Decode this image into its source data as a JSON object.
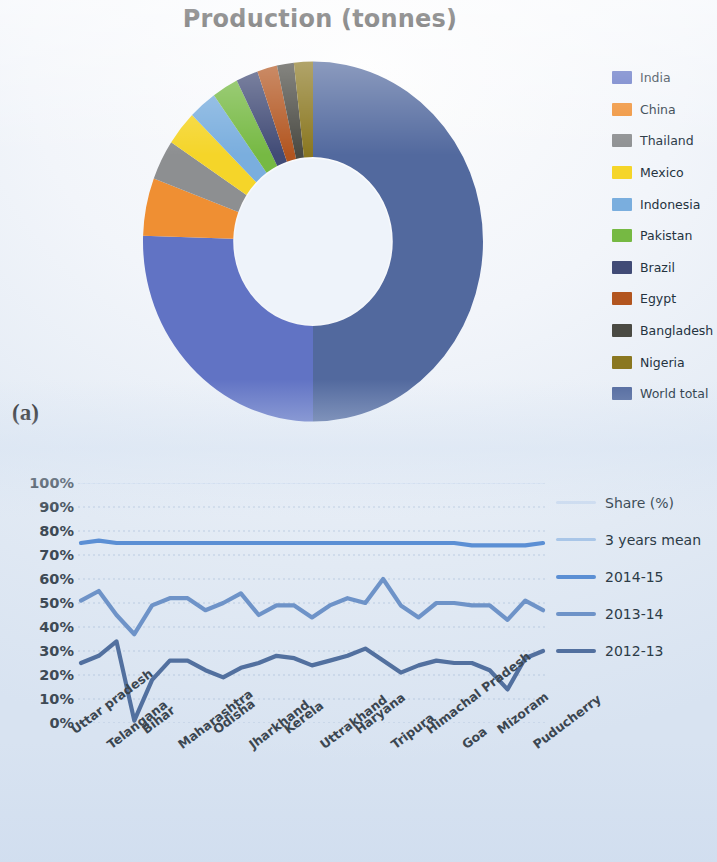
{
  "figure": {
    "panel_a_tag": "(a)",
    "panel_b_tag": "(b)"
  },
  "panel_a": {
    "title": "Production (tonnes)",
    "legend_title": "",
    "legend": [
      {
        "label": "India",
        "color": "#6173c4"
      },
      {
        "label": "China",
        "color": "#ef8f33"
      },
      {
        "label": "Thailand",
        "color": "#8d8f91"
      },
      {
        "label": "Mexico",
        "color": "#f5d529"
      },
      {
        "label": "Indonesia",
        "color": "#7aaede"
      },
      {
        "label": "Pakistan",
        "color": "#76b943"
      },
      {
        "label": "Brazil",
        "color": "#414b76"
      },
      {
        "label": "Egypt",
        "color": "#b2551f"
      },
      {
        "label": "Bangladesh",
        "color": "#4a4a43"
      },
      {
        "label": "Nigeria",
        "color": "#8a7720"
      },
      {
        "label": "World total",
        "color": "#52699e"
      }
    ],
    "chart_data": {
      "type": "pie",
      "title": "Production (tonnes)",
      "donut": true,
      "hole_ratio": 0.46,
      "start_angle_deg": 0,
      "direction": "clockwise",
      "labels": [
        "World total",
        "India",
        "China",
        "Thailand",
        "Mexico",
        "Indonesia",
        "Pakistan",
        "Brazil",
        "Egypt",
        "Bangladesh",
        "Nigeria"
      ],
      "values": [
        50.0,
        25.5,
        5.2,
        3.6,
        3.1,
        2.7,
        2.5,
        2.1,
        1.9,
        1.6,
        1.8
      ],
      "unit": "%",
      "colors": [
        "#52699e",
        "#6173c4",
        "#ef8f33",
        "#8d8f91",
        "#f5d529",
        "#7aaede",
        "#76b943",
        "#414b76",
        "#b2551f",
        "#4a4a43",
        "#8a7720"
      ],
      "legend_position": "right"
    }
  },
  "panel_b": {
    "legend": [
      {
        "label": "Share (%)",
        "color": "#cddcf0"
      },
      {
        "label": "3 years mean",
        "color": "#a9c6e8"
      },
      {
        "label": "2014-15",
        "color": "#5b8fd4"
      },
      {
        "label": "2013-14",
        "color": "#6e93c8"
      },
      {
        "label": "2012-13",
        "color": "#52709f"
      }
    ],
    "y_ticks": [
      "100%",
      "90%",
      "80%",
      "70%",
      "60%",
      "50%",
      "40%",
      "30%",
      "20%",
      "10%",
      "0%"
    ],
    "x_ticks": [
      "Uttar pradesh",
      "Telangana",
      "Bihar",
      "Maharashtra",
      "Odisha",
      "Jharkhand",
      "Kerela",
      "Uttrakhand",
      "Haryana",
      "Tripura",
      "Himachal Pradesh",
      "Goa",
      "Mizoram",
      "Puducherry"
    ],
    "chart_data": {
      "type": "line",
      "title": "",
      "xlabel": "",
      "ylabel": "",
      "ylim": [
        0,
        100
      ],
      "yunit": "%",
      "ytick_step": 10,
      "grid": true,
      "legend_position": "right",
      "categories": [
        "Uttar pradesh",
        "Telangana",
        "Bihar",
        "Maharashtra",
        "Odisha",
        "Jharkhand",
        "Kerela",
        "Uttrakhand",
        "Haryana",
        "Tripura",
        "Himachal Pradesh",
        "Goa",
        "Mizoram",
        "Puducherry"
      ],
      "x_points": 27,
      "note": "14 category labels are placed under every other data point of 27 plotted points",
      "series": [
        {
          "name": "Share (%)",
          "color": "#cddcf0",
          "values": [
            100,
            100,
            100,
            100,
            100,
            100,
            100,
            100,
            100,
            100,
            100,
            100,
            100,
            100,
            100,
            100,
            100,
            100,
            100,
            100,
            100,
            100,
            100,
            100,
            100,
            100,
            100
          ]
        },
        {
          "name": "3 years mean",
          "color": "#a9c6e8",
          "values": [
            75,
            75,
            75,
            75,
            75,
            75,
            75,
            75,
            75,
            75,
            75,
            75,
            75,
            75,
            75,
            75,
            75,
            75,
            75,
            75,
            75,
            75,
            75,
            75,
            75,
            75,
            75
          ]
        },
        {
          "name": "2014-15",
          "color": "#5b8fd4",
          "values": [
            75,
            76,
            75,
            75,
            75,
            75,
            75,
            75,
            75,
            75,
            75,
            75,
            75,
            75,
            75,
            75,
            75,
            75,
            75,
            75,
            75,
            75,
            74,
            74,
            74,
            74,
            75
          ]
        },
        {
          "name": "2013-14",
          "color": "#6e93c8",
          "values": [
            51,
            55,
            45,
            37,
            49,
            52,
            52,
            47,
            50,
            54,
            45,
            49,
            49,
            44,
            49,
            52,
            50,
            60,
            49,
            44,
            50,
            50,
            49,
            49,
            43,
            51,
            47
          ]
        },
        {
          "name": "2012-13",
          "color": "#52709f",
          "values": [
            25,
            28,
            34,
            1,
            18,
            26,
            26,
            22,
            19,
            23,
            25,
            28,
            27,
            24,
            26,
            28,
            31,
            26,
            21,
            24,
            26,
            25,
            25,
            22,
            14,
            27,
            30
          ]
        }
      ],
      "series_plotted_truncated_note": "2013-14 and 2012-13 continue across all 27 points; trailing values approx 2013-14: 50,50,48,48,47,48,51 and 2012-13: 33,35,30,25,22,22,22,26,24"
    }
  }
}
